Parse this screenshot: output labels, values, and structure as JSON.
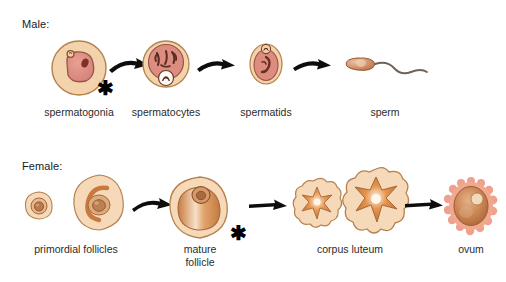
{
  "rows": [
    {
      "id": "male",
      "title": "Male:",
      "stages": [
        {
          "id": "spermatogonia",
          "label": "spermatogonia",
          "art": "spermatogonia-cell"
        },
        {
          "id": "spermatocytes",
          "label": "spermatocytes",
          "art": "spermatocyte-cell"
        },
        {
          "id": "spermatids",
          "label": "spermatids",
          "art": "spermatid-cell"
        },
        {
          "id": "sperm",
          "label": "sperm",
          "art": "sperm-cell"
        }
      ],
      "arrows": 3,
      "asterisks": 1
    },
    {
      "id": "female",
      "title": "Female:",
      "stages": [
        {
          "id": "primordial-follicles",
          "label": "primordial follicles",
          "art": "primordial-follicle-cell"
        },
        {
          "id": "mature-follicle",
          "label": "mature\nfollicle",
          "art": "mature-follicle-cell"
        },
        {
          "id": "corpus-luteum",
          "label": "corpus luteum",
          "art": "corpus-luteum-cell"
        },
        {
          "id": "ovum",
          "label": "ovum",
          "art": "ovum-cell"
        }
      ],
      "arrows": 3,
      "asterisks": 1
    }
  ],
  "annotations": {
    "asterisk_glyph": "✱",
    "asterisk_meaning": "meiosis stage marker"
  },
  "colors": {
    "cell_fill": "#f4d6b3",
    "cell_outline": "#b07a4a",
    "nucleus_red": "#dd8d80",
    "nucleus_outline": "#8c4a3c",
    "chromosome_dark": "#5a2d22",
    "follicle_fill": "#f6d9b8",
    "antrum_orange": "#d98a4e",
    "corpus_center": "#e08a45",
    "ovum_corona": "#f0a08c",
    "ovum_body": "#c2764a",
    "sperm_head": "#d08a5e",
    "sperm_tail": "#6f6259",
    "arrow_black": "#0d0d0d",
    "text": "#2b2b2b",
    "background": "#ffffff"
  }
}
